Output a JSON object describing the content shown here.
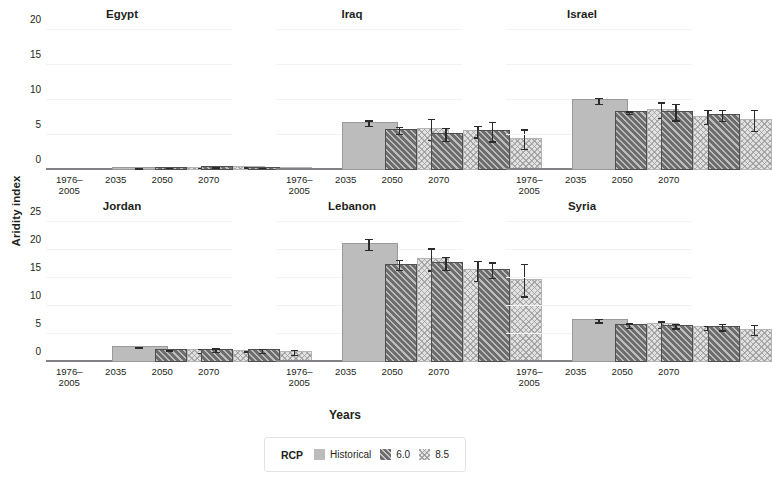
{
  "axis": {
    "ylabel": "Aridity index",
    "xlabel": "Years"
  },
  "legend": {
    "title": "RCP",
    "items": [
      {
        "label": "Historical",
        "swatch": "historical-swatch"
      },
      {
        "label": "6.0",
        "swatch": "rcp60-swatch"
      },
      {
        "label": "8.5",
        "swatch": "rcp85-swatch"
      }
    ]
  },
  "categories": [
    "1976–\n2005",
    "2035",
    "2050",
    "2070"
  ],
  "category_labels": [
    "1976–2005",
    "2035",
    "2050",
    "2070"
  ],
  "chart_data": {
    "type": "bar",
    "xlabel": "Years",
    "ylabel": "Aridity index",
    "grid": false,
    "legend_position": "bottom-center",
    "legend_title": "RCP",
    "categories": [
      "1976–2005",
      "2035",
      "2050",
      "2070"
    ],
    "series_names": [
      "Historical",
      "6.0",
      "8.5"
    ],
    "panels": [
      {
        "name": "Egypt",
        "row": 0,
        "col": 0,
        "ylim": [
          0,
          20
        ],
        "yticks": [
          0,
          5,
          10,
          15,
          20
        ],
        "series": [
          {
            "name": "Historical",
            "values": [
              0.15,
              null,
              null,
              null
            ],
            "errors": [
              0.05,
              null,
              null,
              null
            ]
          },
          {
            "name": "6.0",
            "values": [
              null,
              0.2,
              0.25,
              0.2
            ],
            "errors": [
              null,
              0.1,
              0.12,
              0.1
            ]
          },
          {
            "name": "8.5",
            "values": [
              null,
              0.2,
              0.3,
              0.15
            ],
            "errors": [
              null,
              0.12,
              0.15,
              0.1
            ]
          }
        ]
      },
      {
        "name": "Iraq",
        "row": 0,
        "col": 1,
        "ylim": [
          0,
          20
        ],
        "yticks": [
          0,
          5,
          10,
          15,
          20
        ],
        "series": [
          {
            "name": "Historical",
            "values": [
              6.6,
              null,
              null,
              null
            ],
            "errors": [
              0.5,
              null,
              null,
              null
            ]
          },
          {
            "name": "6.0",
            "values": [
              null,
              5.6,
              5.0,
              5.4
            ],
            "errors": [
              null,
              0.6,
              1.0,
              1.5
            ]
          },
          {
            "name": "8.5",
            "values": [
              null,
              5.7,
              5.4,
              4.3
            ],
            "errors": [
              null,
              1.6,
              0.9,
              1.5
            ]
          }
        ]
      },
      {
        "name": "Israel",
        "row": 0,
        "col": 2,
        "ylim": [
          0,
          20
        ],
        "yticks": [
          0,
          5,
          10,
          15,
          20
        ],
        "series": [
          {
            "name": "Historical",
            "values": [
              9.8,
              null,
              null,
              null
            ],
            "errors": [
              0.5,
              null,
              null,
              null
            ]
          },
          {
            "name": "6.0",
            "values": [
              null,
              8.1,
              8.2,
              7.7
            ],
            "errors": [
              null,
              0.3,
              1.3,
              0.9
            ]
          },
          {
            "name": "8.5",
            "values": [
              null,
              8.5,
              7.5,
              7.0
            ],
            "errors": [
              null,
              1.2,
              1.1,
              1.6
            ]
          }
        ]
      },
      {
        "name": "Jordan",
        "row": 1,
        "col": 0,
        "ylim": [
          0,
          25
        ],
        "yticks": [
          0,
          5,
          10,
          15,
          20,
          25
        ],
        "series": [
          {
            "name": "Historical",
            "values": [
              2.5,
              null,
              null,
              null
            ],
            "errors": [
              0.25,
              null,
              null,
              null
            ]
          },
          {
            "name": "6.0",
            "values": [
              null,
              2.0,
              2.0,
              1.9
            ],
            "errors": [
              null,
              0.2,
              0.45,
              0.45
            ]
          },
          {
            "name": "8.5",
            "values": [
              null,
              1.9,
              1.8,
              1.6
            ],
            "errors": [
              null,
              0.45,
              0.2,
              0.55
            ]
          }
        ]
      },
      {
        "name": "Lebanon",
        "row": 1,
        "col": 1,
        "ylim": [
          0,
          25
        ],
        "yticks": [
          0,
          5,
          10,
          15,
          20,
          25
        ],
        "series": [
          {
            "name": "Historical",
            "values": [
              20.9,
              null,
              null,
              null
            ],
            "errors": [
              1.1,
              null,
              null,
              null
            ]
          },
          {
            "name": "6.0",
            "values": [
              null,
              17.2,
              17.5,
              16.3
            ],
            "errors": [
              null,
              1.0,
              1.3,
              1.5
            ]
          },
          {
            "name": "8.5",
            "values": [
              null,
              18.2,
              16.2,
              14.5
            ],
            "errors": [
              null,
              2.1,
              1.9,
              3.0
            ]
          }
        ]
      },
      {
        "name": "Syria",
        "row": 1,
        "col": 2,
        "ylim": [
          0,
          25
        ],
        "yticks": [
          0,
          5,
          10,
          15,
          20,
          25
        ],
        "series": [
          {
            "name": "Historical",
            "values": [
              7.3,
              null,
              null,
              null
            ],
            "errors": [
              0.45,
              null,
              null,
              null
            ]
          },
          {
            "name": "6.0",
            "values": [
              null,
              6.4,
              6.3,
              6.1
            ],
            "errors": [
              null,
              0.5,
              0.5,
              0.7
            ]
          },
          {
            "name": "8.5",
            "values": [
              null,
              6.6,
              6.0,
              5.6
            ],
            "errors": [
              null,
              0.7,
              0.5,
              1.0
            ]
          }
        ]
      }
    ]
  },
  "colors": {
    "historical": "#bcbcbc",
    "rcp60": "#6d6d6d",
    "rcp85": "#e2e2e2",
    "axis": "#808285",
    "error": "#2b2b2b"
  }
}
